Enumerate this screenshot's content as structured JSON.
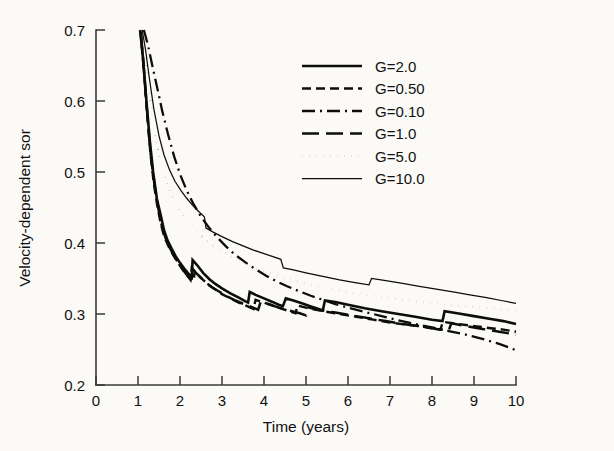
{
  "chart_data": {
    "type": "line",
    "title": "",
    "xlabel": "Time (years)",
    "ylabel": "Velocity-dependent sor",
    "xlim": [
      0,
      10
    ],
    "ylim": [
      0.2,
      0.7
    ],
    "xticks": [
      "0",
      "1",
      "2",
      "3",
      "4",
      "5",
      "6",
      "7",
      "8",
      "9",
      "10"
    ],
    "yticks": [
      "0.2",
      "0.3",
      "0.4",
      "0.5",
      "0.6",
      "0.7"
    ],
    "grid": false,
    "legend_position": "upper-right",
    "series": [
      {
        "name": "G=2.0",
        "style": "solid",
        "width": 2.6,
        "points": [
          [
            1.05,
            0.7
          ],
          [
            1.12,
            0.66
          ],
          [
            1.2,
            0.6
          ],
          [
            1.28,
            0.545
          ],
          [
            1.36,
            0.5
          ],
          [
            1.45,
            0.462
          ],
          [
            1.55,
            0.437
          ],
          [
            1.62,
            0.418
          ],
          [
            1.7,
            0.404
          ],
          [
            1.8,
            0.392
          ],
          [
            1.9,
            0.381
          ],
          [
            2.0,
            0.372
          ],
          [
            2.1,
            0.364
          ],
          [
            2.2,
            0.357
          ],
          [
            2.28,
            0.352
          ],
          [
            2.3,
            0.376
          ],
          [
            2.42,
            0.368
          ],
          [
            2.55,
            0.358
          ],
          [
            2.7,
            0.349
          ],
          [
            2.85,
            0.342
          ],
          [
            3.0,
            0.336
          ],
          [
            3.2,
            0.329
          ],
          [
            3.4,
            0.323
          ],
          [
            3.55,
            0.318
          ],
          [
            3.62,
            0.316
          ],
          [
            3.66,
            0.331
          ],
          [
            3.8,
            0.327
          ],
          [
            4.0,
            0.322
          ],
          [
            4.2,
            0.317
          ],
          [
            4.35,
            0.313
          ],
          [
            4.45,
            0.311
          ],
          [
            4.52,
            0.322
          ],
          [
            4.7,
            0.319
          ],
          [
            4.9,
            0.315
          ],
          [
            5.1,
            0.311
          ],
          [
            5.3,
            0.307
          ],
          [
            5.4,
            0.305
          ],
          [
            5.45,
            0.319
          ],
          [
            5.7,
            0.317
          ],
          [
            6.0,
            0.313
          ],
          [
            6.4,
            0.308
          ],
          [
            6.8,
            0.304
          ],
          [
            7.2,
            0.3
          ],
          [
            7.6,
            0.296
          ],
          [
            8.0,
            0.292
          ],
          [
            8.25,
            0.29
          ],
          [
            8.3,
            0.304
          ],
          [
            8.6,
            0.301
          ],
          [
            9.0,
            0.297
          ],
          [
            9.4,
            0.293
          ],
          [
            9.7,
            0.29
          ],
          [
            10.0,
            0.286
          ]
        ]
      },
      {
        "name": "G=0.50",
        "style": "dashed-short",
        "width": 2.4,
        "points": [
          [
            1.06,
            0.698
          ],
          [
            1.13,
            0.65
          ],
          [
            1.21,
            0.588
          ],
          [
            1.29,
            0.53
          ],
          [
            1.37,
            0.487
          ],
          [
            1.46,
            0.452
          ],
          [
            1.54,
            0.428
          ],
          [
            1.62,
            0.41
          ],
          [
            1.72,
            0.396
          ],
          [
            1.82,
            0.385
          ],
          [
            1.92,
            0.375
          ],
          [
            2.02,
            0.366
          ],
          [
            2.12,
            0.358
          ],
          [
            2.2,
            0.352
          ],
          [
            2.25,
            0.348
          ],
          [
            2.28,
            0.365
          ],
          [
            2.4,
            0.357
          ],
          [
            2.55,
            0.348
          ],
          [
            2.7,
            0.34
          ],
          [
            2.85,
            0.334
          ],
          [
            3.0,
            0.328
          ],
          [
            3.2,
            0.322
          ],
          [
            3.4,
            0.316
          ],
          [
            3.6,
            0.311
          ],
          [
            3.75,
            0.307
          ],
          [
            3.8,
            0.32
          ],
          [
            3.95,
            0.317
          ],
          [
            4.2,
            0.312
          ],
          [
            4.45,
            0.307
          ],
          [
            4.65,
            0.303
          ],
          [
            4.75,
            0.301
          ],
          [
            4.8,
            0.312
          ],
          [
            5.0,
            0.309
          ],
          [
            5.4,
            0.304
          ],
          [
            5.8,
            0.3
          ],
          [
            6.2,
            0.296
          ],
          [
            6.6,
            0.292
          ],
          [
            7.0,
            0.288
          ],
          [
            7.4,
            0.285
          ],
          [
            7.8,
            0.282
          ],
          [
            8.1,
            0.279
          ],
          [
            8.2,
            0.278
          ],
          [
            8.26,
            0.289
          ],
          [
            8.6,
            0.286
          ],
          [
            9.0,
            0.283
          ],
          [
            9.4,
            0.28
          ],
          [
            9.7,
            0.278
          ],
          [
            10.0,
            0.275
          ]
        ]
      },
      {
        "name": "G=0.10",
        "style": "dash-dot",
        "width": 2.3,
        "points": [
          [
            1.14,
            0.7
          ],
          [
            1.24,
            0.678
          ],
          [
            1.34,
            0.65
          ],
          [
            1.46,
            0.618
          ],
          [
            1.58,
            0.585
          ],
          [
            1.72,
            0.552
          ],
          [
            1.86,
            0.522
          ],
          [
            2.0,
            0.497
          ],
          [
            2.16,
            0.474
          ],
          [
            2.32,
            0.455
          ],
          [
            2.5,
            0.437
          ],
          [
            2.7,
            0.421
          ],
          [
            2.9,
            0.407
          ],
          [
            3.1,
            0.395
          ],
          [
            3.3,
            0.384
          ],
          [
            3.55,
            0.373
          ],
          [
            3.8,
            0.363
          ],
          [
            4.05,
            0.354
          ],
          [
            4.3,
            0.346
          ],
          [
            4.55,
            0.339
          ],
          [
            4.8,
            0.333
          ],
          [
            5.1,
            0.326
          ],
          [
            5.4,
            0.32
          ],
          [
            5.7,
            0.314
          ],
          [
            6.0,
            0.309
          ],
          [
            6.4,
            0.303
          ],
          [
            6.8,
            0.297
          ],
          [
            7.2,
            0.291
          ],
          [
            7.6,
            0.286
          ],
          [
            8.0,
            0.281
          ],
          [
            8.4,
            0.276
          ],
          [
            8.8,
            0.271
          ],
          [
            9.2,
            0.265
          ],
          [
            9.6,
            0.258
          ],
          [
            10.0,
            0.249
          ]
        ]
      },
      {
        "name": "G=1.0",
        "style": "dashed-long",
        "width": 2.5,
        "points": [
          [
            1.07,
            0.696
          ],
          [
            1.14,
            0.645
          ],
          [
            1.22,
            0.582
          ],
          [
            1.3,
            0.526
          ],
          [
            1.39,
            0.483
          ],
          [
            1.48,
            0.45
          ],
          [
            1.56,
            0.426
          ],
          [
            1.65,
            0.408
          ],
          [
            1.75,
            0.394
          ],
          [
            1.85,
            0.383
          ],
          [
            1.95,
            0.373
          ],
          [
            2.05,
            0.364
          ],
          [
            2.15,
            0.356
          ],
          [
            2.25,
            0.349
          ],
          [
            2.32,
            0.345
          ],
          [
            2.35,
            0.36
          ],
          [
            2.48,
            0.352
          ],
          [
            2.62,
            0.344
          ],
          [
            2.78,
            0.337
          ],
          [
            2.95,
            0.331
          ],
          [
            3.12,
            0.325
          ],
          [
            3.32,
            0.319
          ],
          [
            3.52,
            0.314
          ],
          [
            3.7,
            0.31
          ],
          [
            3.86,
            0.306
          ],
          [
            3.92,
            0.317
          ],
          [
            4.1,
            0.314
          ],
          [
            4.35,
            0.309
          ],
          [
            4.6,
            0.305
          ],
          [
            4.85,
            0.301
          ],
          [
            5.0,
            0.298
          ],
          [
            5.06,
            0.309
          ],
          [
            5.3,
            0.306
          ],
          [
            5.7,
            0.302
          ],
          [
            6.1,
            0.298
          ],
          [
            6.5,
            0.294
          ],
          [
            6.9,
            0.29
          ],
          [
            7.3,
            0.286
          ],
          [
            7.7,
            0.283
          ],
          [
            8.1,
            0.279
          ],
          [
            8.4,
            0.277
          ],
          [
            8.46,
            0.287
          ],
          [
            8.8,
            0.283
          ],
          [
            9.2,
            0.279
          ],
          [
            9.6,
            0.275
          ],
          [
            10.0,
            0.271
          ]
        ]
      },
      {
        "name": "G=5.0",
        "style": "dotted",
        "width": 2.4,
        "points": [
          [
            1.09,
            0.7
          ],
          [
            1.17,
            0.665
          ],
          [
            1.26,
            0.62
          ],
          [
            1.36,
            0.573
          ],
          [
            1.47,
            0.533
          ],
          [
            1.58,
            0.503
          ],
          [
            1.7,
            0.481
          ],
          [
            1.82,
            0.464
          ],
          [
            1.95,
            0.45
          ],
          [
            2.1,
            0.437
          ],
          [
            2.25,
            0.426
          ],
          [
            2.4,
            0.416
          ],
          [
            2.6,
            0.405
          ],
          [
            2.8,
            0.396
          ],
          [
            3.0,
            0.388
          ],
          [
            3.25,
            0.379
          ],
          [
            3.5,
            0.372
          ],
          [
            3.75,
            0.366
          ],
          [
            4.0,
            0.36
          ],
          [
            4.3,
            0.354
          ],
          [
            4.6,
            0.349
          ],
          [
            4.9,
            0.344
          ],
          [
            5.2,
            0.34
          ],
          [
            5.6,
            0.335
          ],
          [
            6.0,
            0.331
          ],
          [
            6.4,
            0.327
          ],
          [
            6.8,
            0.324
          ],
          [
            7.2,
            0.321
          ],
          [
            7.6,
            0.318
          ],
          [
            8.0,
            0.315
          ],
          [
            8.4,
            0.313
          ],
          [
            8.8,
            0.311
          ],
          [
            9.2,
            0.309
          ],
          [
            9.6,
            0.307
          ],
          [
            10.0,
            0.305
          ]
        ]
      },
      {
        "name": "G=10.0",
        "style": "solid-thin",
        "width": 1.25,
        "points": [
          [
            1.1,
            0.7
          ],
          [
            1.18,
            0.672
          ],
          [
            1.27,
            0.632
          ],
          [
            1.38,
            0.588
          ],
          [
            1.5,
            0.551
          ],
          [
            1.62,
            0.524
          ],
          [
            1.75,
            0.503
          ],
          [
            1.88,
            0.487
          ],
          [
            2.02,
            0.474
          ],
          [
            2.16,
            0.463
          ],
          [
            2.3,
            0.453
          ],
          [
            2.45,
            0.444
          ],
          [
            2.58,
            0.437
          ],
          [
            2.62,
            0.421
          ],
          [
            2.8,
            0.415
          ],
          [
            3.0,
            0.409
          ],
          [
            3.25,
            0.402
          ],
          [
            3.5,
            0.396
          ],
          [
            3.75,
            0.39
          ],
          [
            4.0,
            0.385
          ],
          [
            4.25,
            0.38
          ],
          [
            4.4,
            0.377
          ],
          [
            4.46,
            0.365
          ],
          [
            4.7,
            0.362
          ],
          [
            5.0,
            0.358
          ],
          [
            5.4,
            0.353
          ],
          [
            5.8,
            0.348
          ],
          [
            6.2,
            0.344
          ],
          [
            6.5,
            0.341
          ],
          [
            6.56,
            0.35
          ],
          [
            6.9,
            0.347
          ],
          [
            7.3,
            0.343
          ],
          [
            7.7,
            0.339
          ],
          [
            8.1,
            0.335
          ],
          [
            8.5,
            0.331
          ],
          [
            8.9,
            0.327
          ],
          [
            9.3,
            0.323
          ],
          [
            9.65,
            0.319
          ],
          [
            10.0,
            0.315
          ]
        ]
      }
    ]
  },
  "legend": {
    "entries": [
      {
        "label": "G=2.0"
      },
      {
        "label": "G=0.50"
      },
      {
        "label": "G=0.10"
      },
      {
        "label": "G=1.0"
      },
      {
        "label": "G=5.0"
      },
      {
        "label": "G=10.0"
      }
    ]
  },
  "colors": {
    "ink": "#0d0d0d",
    "axis": "#3a3a3a",
    "background": "#fbfaf7"
  }
}
